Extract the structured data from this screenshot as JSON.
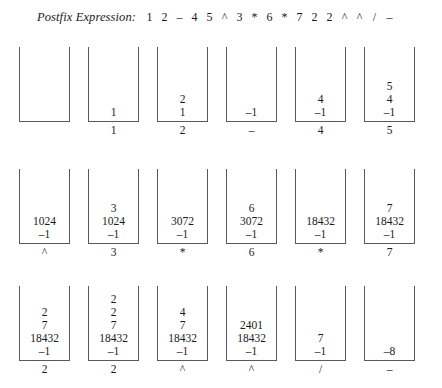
{
  "header": {
    "label": "Postfix Expression:",
    "tokens": [
      "1",
      "2",
      "–",
      "4",
      "5",
      "^",
      "3",
      "*",
      "6",
      "*",
      "7",
      "2",
      "2",
      "^",
      "^",
      "/",
      "–"
    ]
  },
  "style": {
    "border_color": "#5a5a5a",
    "text_color": "#1a1a1a",
    "background": "#ffffff"
  },
  "layout": {
    "columns": 6,
    "rows": 3,
    "column_pitch_px": 69,
    "first_column_left_px": 19,
    "box_width_px": 51,
    "box_height_px": 75
  },
  "trace": {
    "rows": [
      {
        "cells": [
          {
            "label": "",
            "items": []
          },
          {
            "label": "1",
            "items": [
              "1"
            ]
          },
          {
            "label": "2",
            "items": [
              "1",
              "2"
            ]
          },
          {
            "label": "–",
            "items": [
              "–1"
            ]
          },
          {
            "label": "4",
            "items": [
              "–1",
              "4"
            ]
          },
          {
            "label": "5",
            "items": [
              "–1",
              "4",
              "5"
            ]
          }
        ]
      },
      {
        "cells": [
          {
            "label": "^",
            "items": [
              "–1",
              "1024"
            ]
          },
          {
            "label": "3",
            "items": [
              "–1",
              "1024",
              "3"
            ]
          },
          {
            "label": "*",
            "items": [
              "–1",
              "3072"
            ]
          },
          {
            "label": "6",
            "items": [
              "–1",
              "3072",
              "6"
            ]
          },
          {
            "label": "*",
            "items": [
              "–1",
              "18432"
            ]
          },
          {
            "label": "7",
            "items": [
              "–1",
              "18432",
              "7"
            ]
          }
        ]
      },
      {
        "cells": [
          {
            "label": "2",
            "items": [
              "–1",
              "18432",
              "7",
              "2"
            ]
          },
          {
            "label": "2",
            "items": [
              "–1",
              "18432",
              "7",
              "2",
              "2"
            ]
          },
          {
            "label": "^",
            "items": [
              "–1",
              "18432",
              "7",
              "4"
            ]
          },
          {
            "label": "^",
            "items": [
              "–1",
              "18432",
              "2401"
            ]
          },
          {
            "label": "/",
            "items": [
              "–1",
              "7"
            ]
          },
          {
            "label": "–",
            "items": [
              "–8"
            ]
          }
        ]
      }
    ]
  }
}
